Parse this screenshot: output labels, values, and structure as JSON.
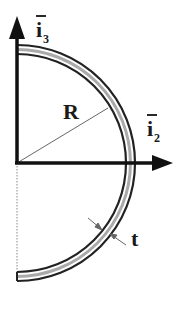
{
  "diagram": {
    "type": "half-ring cross-section with coordinate axes",
    "axes": {
      "vertical": {
        "label": "i",
        "subscript": "3",
        "overbar": true
      },
      "horizontal": {
        "label": "i",
        "subscript": "2",
        "overbar": true
      }
    },
    "radius_label": "R",
    "thickness_label": "t",
    "colors": {
      "stroke": "#1a1a1a",
      "inner_band": "#9a9a9a",
      "dashed_line": "#888888",
      "background": "#ffffff"
    }
  }
}
